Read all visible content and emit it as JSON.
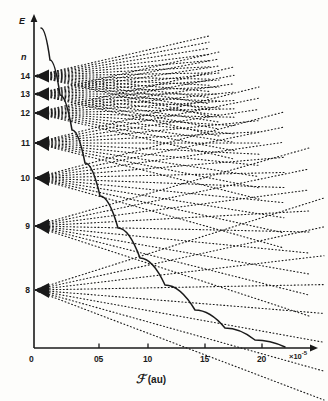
{
  "figure": {
    "kind": "stark-map",
    "background": "#fdfdfb",
    "ink": "#1a1a1a"
  },
  "axes": {
    "y_label": "E",
    "y_sub_label": "n",
    "x_label_symbol": "ℱ",
    "x_label_units": "(au)",
    "x_exponent_prefix": "×10",
    "x_exponent_power": "-5",
    "x_ticks": [
      {
        "label": "0",
        "value": 0.0,
        "x": 34
      },
      {
        "label": "05",
        "value": 0.5,
        "x": 99
      },
      {
        "label": "10",
        "value": 1.0,
        "x": 148
      },
      {
        "label": "15",
        "value": 1.5,
        "x": 205
      },
      {
        "label": "20",
        "value": 2.0,
        "x": 262
      }
    ],
    "x_range": [
      0.0,
      2.3
    ],
    "origin_px": {
      "x": 34,
      "y": 348
    },
    "x_axis_end_px": 318,
    "y_axis_top_px": 14,
    "grid": false,
    "legend": "none"
  },
  "chart_data": {
    "type": "line",
    "title": "",
    "xlabel": "ℱ (au)  ×10⁻⁵",
    "ylabel": "E",
    "xlim": [
      0.0,
      2.3
    ],
    "levels": [
      {
        "n": 14,
        "y": 76,
        "label": "14",
        "count": 14,
        "spread_up": 40,
        "spread_down": 40,
        "reach": 175
      },
      {
        "n": 13,
        "y": 94,
        "label": "13",
        "count": 13,
        "spread_up": 42,
        "spread_down": 42,
        "reach": 185
      },
      {
        "n": 12,
        "y": 113,
        "label": "12",
        "count": 12,
        "spread_up": 46,
        "spread_down": 46,
        "reach": 200
      },
      {
        "n": 11,
        "y": 143,
        "label": "11",
        "count": 11,
        "spread_up": 56,
        "spread_down": 56,
        "reach": 225
      },
      {
        "n": 10,
        "y": 178,
        "label": "10",
        "count": 10,
        "spread_up": 66,
        "spread_down": 70,
        "reach": 250
      },
      {
        "n": 9,
        "y": 226,
        "label": "9",
        "count": 9,
        "spread_up": 78,
        "spread_down": 90,
        "reach": 275
      },
      {
        "n": 8,
        "y": 290,
        "label": "8",
        "count": 8,
        "spread_up": 92,
        "spread_down": 110,
        "reach": 290
      }
    ],
    "ionization_curve": {
      "name": "classical-ionization-limit",
      "points": [
        [
          41,
          28
        ],
        [
          50,
          60
        ],
        [
          60,
          95
        ],
        [
          72,
          130
        ],
        [
          85,
          163
        ],
        [
          100,
          196
        ],
        [
          118,
          228
        ],
        [
          140,
          258
        ],
        [
          165,
          285
        ],
        [
          195,
          310
        ],
        [
          225,
          328
        ],
        [
          255,
          340
        ],
        [
          285,
          347
        ]
      ]
    }
  }
}
